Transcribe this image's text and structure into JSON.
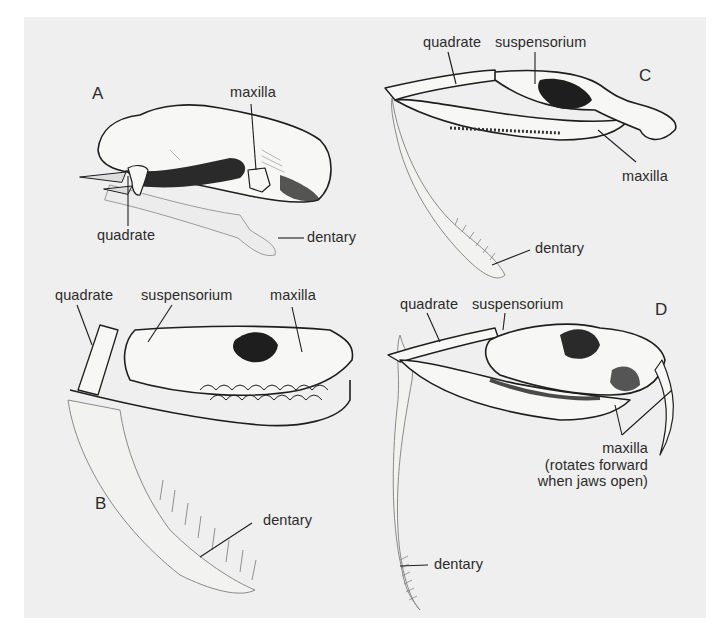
{
  "figure": {
    "background_color": "#efefef",
    "line_color": "#1e1e1e",
    "bone_fill": "#f7f7f5",
    "shadow_fill": "#2a2a2a",
    "panels": [
      {
        "id": "A",
        "letter": "A",
        "labels": {
          "maxilla": "maxilla",
          "quadrate": "quadrate",
          "dentary": "dentary"
        }
      },
      {
        "id": "B",
        "letter": "B",
        "labels": {
          "quadrate": "quadrate",
          "suspensorium": "suspensorium",
          "maxilla": "maxilla",
          "dentary": "dentary"
        }
      },
      {
        "id": "C",
        "letter": "C",
        "labels": {
          "quadrate": "quadrate",
          "suspensorium": "suspensorium",
          "maxilla": "maxilla",
          "dentary": "dentary"
        }
      },
      {
        "id": "D",
        "letter": "D",
        "labels": {
          "quadrate": "quadrate",
          "suspensorium": "suspensorium",
          "maxilla_line1": "maxilla",
          "maxilla_line2": "(rotates forward",
          "maxilla_line3": "when jaws open)",
          "dentary": "dentary"
        }
      }
    ]
  }
}
